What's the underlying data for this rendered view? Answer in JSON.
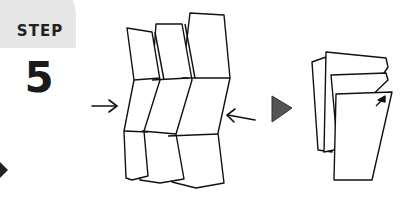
{
  "step": {
    "label": "STEP",
    "number": "5"
  },
  "colors": {
    "badge": "#e6e6e6",
    "arrow_fill": "#555555",
    "ink": "#111111"
  },
  "icons": [
    "left-triangle-arrow-icon",
    "right-pointing-arrow-icon",
    "left-pointing-arrow-icon",
    "play-triangle-icon",
    "corner-arrow-icon"
  ]
}
